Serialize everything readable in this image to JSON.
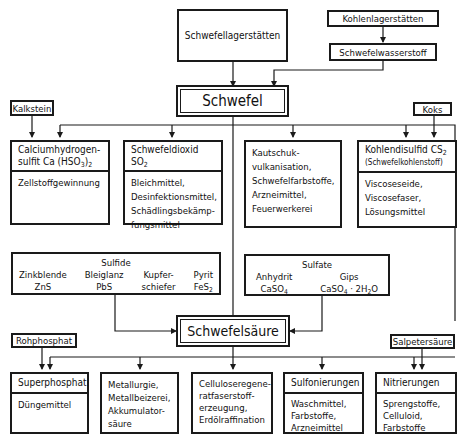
{
  "diagram": {
    "sources": {
      "schwefellagerstaetten": "Schwefellagerstätten",
      "kohlenlagerstaetten": "Kohlenlagerstätten",
      "schwefelwasserstoff": "Schwefelwasserstoff",
      "kalkstein": "Kalkstein",
      "koks": "Koks",
      "rohphosphat": "Rohphosphat",
      "salpetersaeure": "Salpetersäure"
    },
    "hubs": {
      "schwefel": "Schwefel",
      "schwefelsaeure": "Schwefelsäure"
    },
    "schwefel_products": [
      {
        "title_line1": "Calciumhydrogen-",
        "title_line2": "sulfit  Ca (HSO",
        "title_sub": "3",
        "title_end": ")",
        "title_sub2": "2",
        "uses": "Zellstoffgewinnung"
      },
      {
        "title_line1": "Schwefeldioxid",
        "title_line2": "SO",
        "title_sub": "2",
        "uses": "Bleichmittel,\nDesinfektionsmittel,\nSchädlingsbekämp-\nfungsmittel"
      },
      {
        "uses": "Kautschuk-\nvulkanisation,\nSchwefelfarbstoffe,\nArzneimittel,\nFeuerwerkerei"
      },
      {
        "title_line1": "Kohlendisulfid  CS",
        "title_sub": "2",
        "title_line2": "(Schwefelkohlenstoff)",
        "uses": "Viscoseseide,\nViscosefaser,\nLösungsmittel"
      }
    ],
    "sulfide": {
      "title": "Sulfide",
      "items": [
        {
          "name": "Zinkblende",
          "formula": "ZnS"
        },
        {
          "name": "Bleiglanz",
          "formula": "PbS"
        },
        {
          "name": "Kupfer-",
          "formula": "schiefer"
        },
        {
          "name": "Pyrit",
          "formula": "FeS",
          "formula_sub": "2"
        }
      ]
    },
    "sulfate": {
      "title": "Sulfate",
      "items": [
        {
          "name": "Anhydrit",
          "formula": "CaSO",
          "formula_sub": "4"
        },
        {
          "name": "Gips",
          "formula": "CaSO",
          "formula_sub": "4",
          "formula_end": " · 2H",
          "formula_sub2": "2",
          "formula_tail": "O"
        }
      ]
    },
    "schwefelsaeure_products": [
      {
        "title": "Superphosphat",
        "uses": "Düngemittel"
      },
      {
        "uses": "Metallurgie,\nMetallbeizerei,\nAkkumulator-\nsäure"
      },
      {
        "uses": "Celluloseregene-\nratfaserstoff-\nerzeugung,\nErdölraffination"
      },
      {
        "title": "Sulfonierungen",
        "uses": "Waschmittel,\nFarbstoffe,\nArzneimittel"
      },
      {
        "title": "Nitrierungen",
        "uses": "Sprengstoffe,\nCelluloid,\nFarbstoffe"
      }
    ],
    "colors": {
      "line": "#1a1a1a",
      "background": "#ffffff"
    }
  }
}
